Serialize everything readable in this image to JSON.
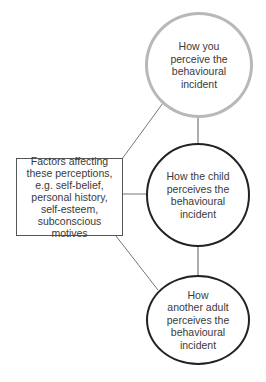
{
  "diagram": {
    "factors_box": {
      "text": "Factors affecting\nthese perceptions,\ne.g. self-belief,\npersonal history,\nself-esteem,\nsubconscious\nmotives"
    },
    "nodes": [
      {
        "id": "you",
        "text": "How you\nperceive the\nbehavioural\nincident",
        "border_color": "#b8b8b8"
      },
      {
        "id": "child",
        "text": "How the child\nperceives the\nbehavioural\nincident",
        "border_color": "#222222"
      },
      {
        "id": "adult",
        "text": "How\nanother adult\nperceives the\nbehavioural\nincident",
        "border_color": "#222222"
      }
    ],
    "colors": {
      "line": "#777777",
      "text": "#3a3a3a",
      "background": "#ffffff"
    }
  }
}
